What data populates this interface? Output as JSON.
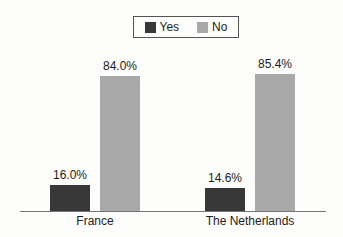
{
  "chart_data": {
    "type": "bar",
    "categories": [
      "France",
      "The Netherlands"
    ],
    "series": [
      {
        "name": "Yes",
        "color": "#383838",
        "values": [
          16.0,
          14.6
        ],
        "labels": [
          "16.0%",
          "14.6%"
        ]
      },
      {
        "name": "No",
        "color": "#a8a8a8",
        "values": [
          84.0,
          85.4
        ],
        "labels": [
          "84.0%",
          "85.4%"
        ]
      }
    ],
    "ylim": [
      0,
      100
    ],
    "grid": false,
    "legend_position": "top-center",
    "value_label_format": "percent-one-decimal",
    "axis_color": "#777777",
    "background_color": "#fcfcfb"
  }
}
